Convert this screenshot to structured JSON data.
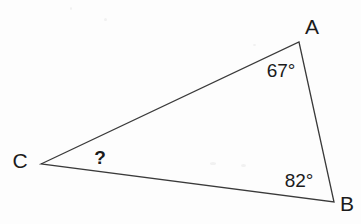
{
  "figure": {
    "type": "geometry-diagram",
    "shape": "triangle",
    "background_color": "#fdfdfd",
    "stroke_color": "#3a3a3a",
    "text_color": "#1b1b1b",
    "stroke_width": 1.3,
    "vertices": [
      {
        "name": "A",
        "label": "A",
        "x": 299,
        "y": 42,
        "label_x": 312,
        "label_y": 26
      },
      {
        "name": "B",
        "label": "B",
        "x": 334,
        "y": 202,
        "label_x": 347,
        "label_y": 203
      },
      {
        "name": "C",
        "label": "C",
        "x": 41,
        "y": 164,
        "label_x": 20,
        "label_y": 160
      }
    ],
    "angles": [
      {
        "at": "A",
        "label": "67°",
        "value": 67,
        "known": true,
        "x": 281,
        "y": 70
      },
      {
        "at": "B",
        "label": "82°",
        "value": 82,
        "known": true,
        "x": 299,
        "y": 180
      },
      {
        "at": "C",
        "label": "?",
        "value": null,
        "known": false,
        "x": 100,
        "y": 157
      }
    ],
    "edges": [
      {
        "from": "C",
        "to": "A"
      },
      {
        "from": "A",
        "to": "B"
      },
      {
        "from": "B",
        "to": "C"
      }
    ]
  }
}
